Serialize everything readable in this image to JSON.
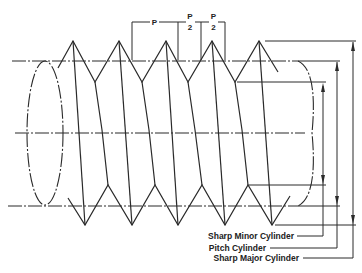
{
  "diagram": {
    "pitch_labels": {
      "pitch": "P",
      "half_pitch_numerator": "P",
      "half_pitch_denominator": "2"
    },
    "cylinder_labels": [
      {
        "id": "minor",
        "text": "Sharp Minor Cylinder"
      },
      {
        "id": "pitch",
        "text": "Pitch Cylinder"
      },
      {
        "id": "major",
        "text": "Sharp Major Cylinder"
      }
    ],
    "colors": {
      "line": "#2a2a2a",
      "background": "#ffffff"
    }
  }
}
